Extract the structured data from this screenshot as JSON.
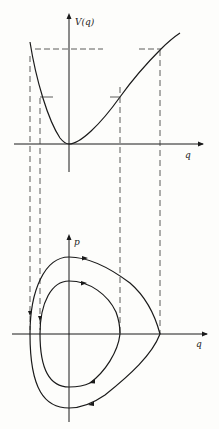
{
  "top_plot": {
    "y_label": "V(q)",
    "x_label": "q"
  },
  "bottom_plot": {
    "y_label": "p",
    "x_label": "q"
  },
  "colors": {
    "ink": "#1a1a1a",
    "background": "#fdfdfb"
  }
}
